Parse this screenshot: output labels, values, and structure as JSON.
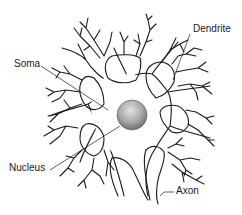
{
  "diagram": {
    "labels": {
      "dendrite": "Dendrite",
      "soma": "Soma",
      "nucleus": "Nucleus",
      "axon": "Axon"
    },
    "colors": {
      "line": "#1a1a1a",
      "nucleus_light": "#d8d8d8",
      "nucleus_dark": "#7a7a7a",
      "background": "#ffffff"
    }
  }
}
